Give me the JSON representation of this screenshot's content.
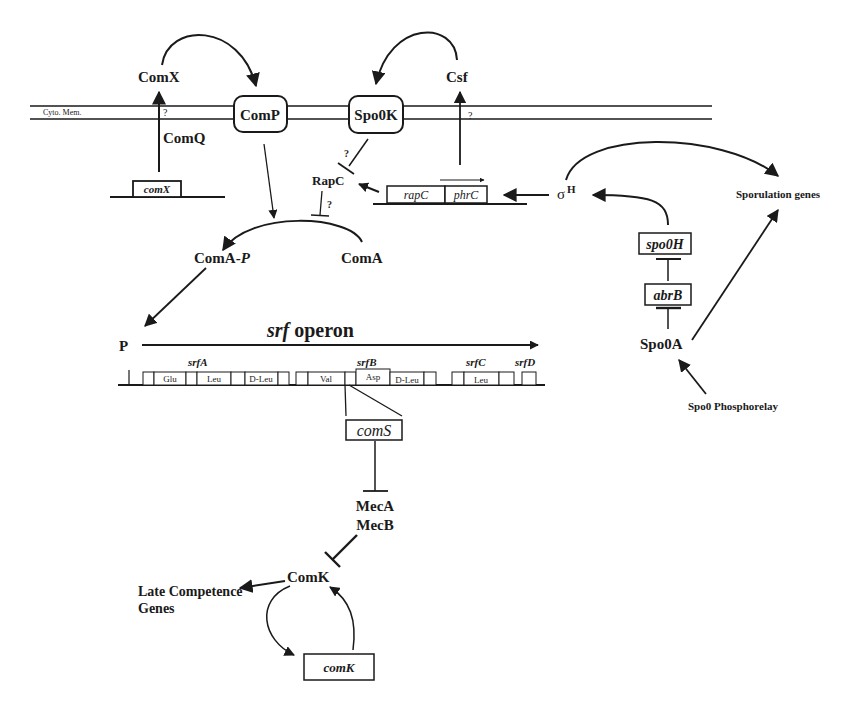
{
  "diagram": {
    "membrane": {
      "label": "Cyto. Mem."
    },
    "nodes": {
      "comX_protein": "ComX",
      "comQ": "ComQ",
      "comX_gene": "comX",
      "comP": "ComP",
      "spo0K": "Spo0K",
      "csf": "Csf",
      "rapC_protein": "RapC",
      "rapC_gene": "rapC",
      "phrC_gene": "phrC",
      "sigmaH": "σ",
      "sigmaH_sup": "H",
      "sporulation_genes": "Sporulation genes",
      "spo0H": "spo0H",
      "abrB": "abrB",
      "spo0A": "Spo0A",
      "spo0_phosphorelay": "Spo0 Phosphorelay",
      "comA_p": "ComA-",
      "comA_p_italic": "P",
      "comA": "ComA",
      "promoter": "P",
      "srf_operon_italic": "srf",
      "srf_operon": " operon",
      "srfA": "srfA",
      "srfB": "srfB",
      "srfC": "srfC",
      "srfD": "srfD",
      "comS": "comS",
      "mecA": "MecA",
      "mecB": "MecB",
      "comK_protein": "ComK",
      "late_genes_1": "Late Competence",
      "late_genes_2": "Genes",
      "comK_gene": "comK"
    },
    "question_marks": {
      "q1": "?",
      "q2": "?",
      "q3": "?",
      "q4": "?"
    },
    "srf_modules": [
      {
        "label": ""
      },
      {
        "label": "Glu"
      },
      {
        "label": ""
      },
      {
        "label": "Leu"
      },
      {
        "label": ""
      },
      {
        "label": "D-Leu"
      },
      {
        "label": ""
      },
      {
        "label": ""
      },
      {
        "label": "Val"
      },
      {
        "label": ""
      },
      {
        "label": "Asp"
      },
      {
        "label": "D-Leu"
      },
      {
        "label": ""
      },
      {
        "label": ""
      },
      {
        "label": "Leu"
      },
      {
        "label": ""
      },
      {
        "label": ""
      }
    ],
    "edges": [
      {
        "from": "ComQ",
        "to": "ComX",
        "type": "activation"
      },
      {
        "from": "ComX",
        "to": "ComP",
        "type": "activation"
      },
      {
        "from": "Csf",
        "to": "Spo0K",
        "type": "activation"
      },
      {
        "from": "phrC",
        "to": "Csf",
        "type": "activation"
      },
      {
        "from": "Spo0K",
        "to": "RapC",
        "type": "inhibition",
        "uncertain": true
      },
      {
        "from": "rapC",
        "to": "RapC",
        "type": "activation"
      },
      {
        "from": "RapC",
        "to": "ComA-P",
        "type": "inhibition",
        "uncertain": true
      },
      {
        "from": "ComP",
        "to": "ComA-P",
        "type": "activation"
      },
      {
        "from": "ComA",
        "to": "ComA-P",
        "type": "conversion"
      },
      {
        "from": "σH",
        "to": "rapC/phrC",
        "type": "activation"
      },
      {
        "from": "σH",
        "to": "Sporulation genes",
        "type": "activation"
      },
      {
        "from": "spo0H",
        "to": "σH",
        "type": "activation"
      },
      {
        "from": "abrB",
        "to": "spo0H",
        "type": "inhibition"
      },
      {
        "from": "Spo0A",
        "to": "abrB",
        "type": "inhibition"
      },
      {
        "from": "Spo0A",
        "to": "Sporulation genes",
        "type": "activation"
      },
      {
        "from": "Spo0 Phosphorelay",
        "to": "Spo0A",
        "type": "activation"
      },
      {
        "from": "ComA-P",
        "to": "P (srf)",
        "type": "activation"
      },
      {
        "from": "comS",
        "to": "MecA/MecB",
        "type": "inhibition"
      },
      {
        "from": "MecA/MecB",
        "to": "ComK",
        "type": "inhibition"
      },
      {
        "from": "ComK",
        "to": "Late Competence Genes",
        "type": "activation"
      },
      {
        "from": "ComK",
        "to": "comK",
        "type": "activation"
      },
      {
        "from": "comK",
        "to": "ComK",
        "type": "activation"
      }
    ]
  }
}
